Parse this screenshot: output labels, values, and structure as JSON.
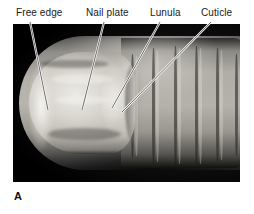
{
  "figure": {
    "panel_letter": "A",
    "color_mode": "grayscale",
    "background_color": "#ffffff",
    "photo_background_color": "#000000",
    "leader_line_color": "#ffffff",
    "label_text_color": "#1a1a1a"
  },
  "labels": [
    {
      "id": "free-edge",
      "text": "Free edge",
      "x": 16,
      "y": 7
    },
    {
      "id": "nail-plate",
      "text": "Nail plate",
      "x": 86,
      "y": 7
    },
    {
      "id": "lunula",
      "text": "Lunula",
      "x": 150,
      "y": 7
    },
    {
      "id": "cuticle",
      "text": "Cuticle",
      "x": 201,
      "y": 7
    }
  ],
  "leaders": [
    {
      "id": "leader-free-edge",
      "x1": 30,
      "y1": 22,
      "x2": 48,
      "y2": 110
    },
    {
      "id": "leader-nail-plate",
      "x1": 104,
      "y1": 22,
      "x2": 82,
      "y2": 110
    },
    {
      "id": "leader-lunula",
      "x1": 160,
      "y1": 22,
      "x2": 112,
      "y2": 108
    },
    {
      "id": "leader-cuticle",
      "x1": 211,
      "y1": 22,
      "x2": 122,
      "y2": 112
    }
  ],
  "photo": {
    "frame_x": 13,
    "frame_y": 24,
    "frame_width": 227,
    "frame_height": 158
  }
}
